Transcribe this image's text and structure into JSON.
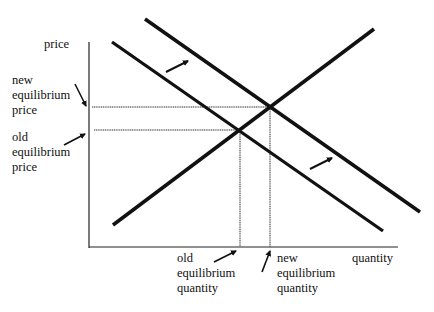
{
  "diagram": {
    "type": "supply-demand",
    "y_axis_label": "price",
    "x_axis_label": "quantity",
    "new_eq_price_label": [
      "new",
      "equilibrium",
      "price"
    ],
    "old_eq_price_label": [
      "old",
      "equilibrium",
      "price"
    ],
    "old_eq_quantity_label": [
      "old",
      "equilibrium",
      "quantity"
    ],
    "new_eq_quantity_label": [
      "new",
      "equilibrium",
      "quantity"
    ],
    "lines": [
      {
        "name": "old demand curve",
        "from": [
          112,
          42
        ],
        "to": [
          383,
          231
        ]
      },
      {
        "name": "new demand curve",
        "from": [
          145,
          19
        ],
        "to": [
          420,
          212
        ]
      },
      {
        "name": "supply curve",
        "from": [
          113,
          225
        ],
        "to": [
          374,
          29
        ]
      }
    ],
    "equilibria": {
      "old": {
        "x": 240,
        "y": 130
      },
      "new": {
        "x": 270,
        "y": 107
      }
    },
    "shift_direction": "right",
    "line_color": "#111111"
  }
}
